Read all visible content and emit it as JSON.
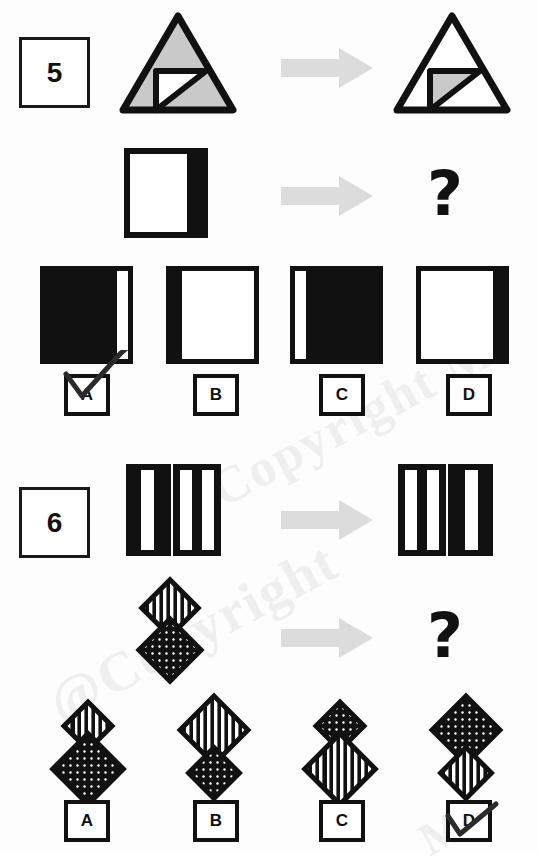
{
  "page": {
    "background": "#fdfdfd",
    "ink": "#111111",
    "gray_fill": "#c9c9c9",
    "arrow_color": "#dcdcdc",
    "watermark_color": "#f0efef",
    "watermark_texts": [
      "Copyright M",
      "@Copyright",
      "M"
    ]
  },
  "puzzles": [
    {
      "number": "5",
      "question_mark": "?",
      "rows": [
        {
          "left_shape": "triangle-gray-with-white-inner-square-triangle",
          "arrow": "right-arrow",
          "right_shape": "triangle-white-with-gray-inner-square-triangle"
        },
        {
          "left_shape": "white-square-black-right-band",
          "arrow": "right-arrow",
          "right_shape": "question-mark"
        }
      ],
      "options": [
        {
          "letter": "A",
          "shape": "black-square-white-band-right",
          "selected": true
        },
        {
          "letter": "B",
          "shape": "white-square-black-band-left",
          "selected": false
        },
        {
          "letter": "C",
          "shape": "black-square-white-band-left",
          "selected": false
        },
        {
          "letter": "D",
          "shape": "white-square-black-band-right",
          "selected": false
        }
      ]
    },
    {
      "number": "6",
      "question_mark": "?",
      "rows": [
        {
          "left_shape": "two-black-bars-left-one-stripe-right-two-stripes",
          "arrow": "right-arrow",
          "right_shape": "two-black-bars-left-two-stripes-right-one-stripe"
        },
        {
          "left_shape": "striped-diamond-above-dotted-diamond",
          "arrow": "right-arrow",
          "right_shape": "question-mark"
        }
      ],
      "options": [
        {
          "letter": "A",
          "shape": "small-striped-diamond-above-large-dotted-diamond",
          "selected": false
        },
        {
          "letter": "B",
          "shape": "large-striped-diamond-above-small-dotted-diamond",
          "selected": false
        },
        {
          "letter": "C",
          "shape": "small-dotted-diamond-above-large-striped-diamond",
          "selected": false
        },
        {
          "letter": "D",
          "shape": "large-dotted-diamond-above-small-striped-diamond",
          "selected": true
        }
      ]
    }
  ]
}
